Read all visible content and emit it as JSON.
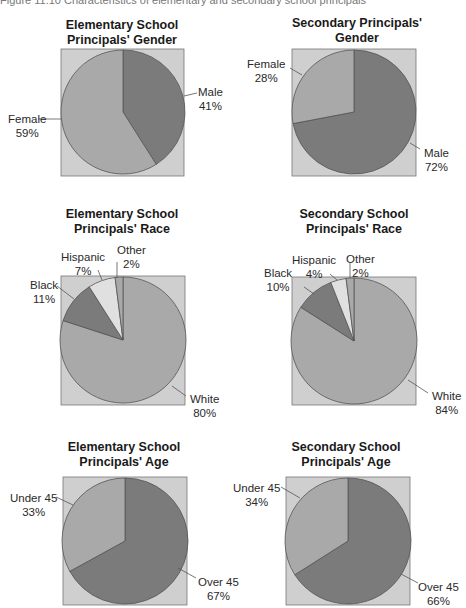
{
  "caption": "Figure 11.10 Characteristics of elementary and secondary school principals",
  "colors": {
    "background_box": "#cfcfcf",
    "light_slice": "#a9a9a9",
    "dark_slice": "#7b7b7b",
    "lightest_slice": "#e0e0e0",
    "outline": "#555555"
  },
  "charts": {
    "elem_gender": {
      "title_line1": "Elementary School",
      "title_line2": "Principals' Gender",
      "labels": {
        "male_name": "Male",
        "male_pct": "41%",
        "female_name": "Female",
        "female_pct": "59%"
      }
    },
    "sec_gender": {
      "title_line1": "Secondary Principals'",
      "title_line2": "Gender",
      "labels": {
        "female_name": "Female",
        "female_pct": "28%",
        "male_name": "Male",
        "male_pct": "72%"
      }
    },
    "elem_race": {
      "title_line1": "Elementary School",
      "title_line2": "Principals' Race",
      "labels": {
        "hispanic_name": "Hispanic",
        "hispanic_pct": "7%",
        "other_name": "Other",
        "other_pct": "2%",
        "black_name": "Black",
        "black_pct": "11%",
        "white_name": "White",
        "white_pct": "80%"
      }
    },
    "sec_race": {
      "title_line1": "Secondary School",
      "title_line2": "Principals' Race",
      "labels": {
        "hispanic_name": "Hispanic",
        "hispanic_pct": "4%",
        "other_name": "Other",
        "other_pct": "2%",
        "black_name": "Black",
        "black_pct": "10%",
        "white_name": "White",
        "white_pct": "84%"
      }
    },
    "elem_age": {
      "title_line1": "Elementary School",
      "title_line2": "Principals' Age",
      "labels": {
        "under_name": "Under 45",
        "under_pct": "33%",
        "over_name": "Over 45",
        "over_pct": "67%"
      }
    },
    "sec_age": {
      "title_line1": "Secondary School",
      "title_line2": "Principals' Age",
      "labels": {
        "under_name": "Under 45",
        "under_pct": "34%",
        "over_name": "Over 45",
        "over_pct": "66%"
      }
    }
  },
  "chart_data": [
    {
      "type": "pie",
      "title": "Elementary School Principals' Gender",
      "categories": [
        "Male",
        "Female"
      ],
      "values": [
        41,
        59
      ]
    },
    {
      "type": "pie",
      "title": "Secondary Principals' Gender",
      "categories": [
        "Male",
        "Female"
      ],
      "values": [
        72,
        28
      ]
    },
    {
      "type": "pie",
      "title": "Elementary School Principals' Race",
      "categories": [
        "White",
        "Black",
        "Hispanic",
        "Other"
      ],
      "values": [
        80,
        11,
        7,
        2
      ]
    },
    {
      "type": "pie",
      "title": "Secondary School Principals' Race",
      "categories": [
        "White",
        "Black",
        "Hispanic",
        "Other"
      ],
      "values": [
        84,
        10,
        4,
        2
      ]
    },
    {
      "type": "pie",
      "title": "Elementary School Principals' Age",
      "categories": [
        "Over 45",
        "Under 45"
      ],
      "values": [
        67,
        33
      ]
    },
    {
      "type": "pie",
      "title": "Secondary School Principals' Age",
      "categories": [
        "Over 45",
        "Under 45"
      ],
      "values": [
        66,
        34
      ]
    }
  ]
}
